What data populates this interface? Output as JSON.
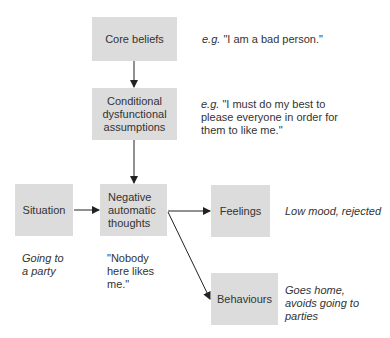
{
  "nodes": {
    "core": {
      "label": "Core beliefs",
      "note_prefix": "e.g.",
      "note": " \"I am a bad person.\""
    },
    "conditional": {
      "label_lines": [
        "Conditional",
        "dysfunctional",
        "assumptions"
      ],
      "note_prefix": "e.g.",
      "note_lines": [
        " \"I must do my best to",
        "please everyone in order for",
        "them to like me.\""
      ]
    },
    "situation": {
      "label": "Situation",
      "note_lines": [
        "Going to",
        "a party"
      ]
    },
    "negative": {
      "label_lines": [
        "Negative",
        "automatic",
        "thoughts"
      ],
      "note_lines": [
        "\"Nobody",
        "here likes",
        "me.\""
      ]
    },
    "feelings": {
      "label": "Feelings",
      "note": "Low mood, rejected"
    },
    "behaviours": {
      "label": "Behaviours",
      "note_lines": [
        "Goes home,",
        "avoids going to",
        "parties"
      ]
    }
  },
  "edges": [
    {
      "from": "core",
      "to": "conditional"
    },
    {
      "from": "conditional",
      "to": "negative"
    },
    {
      "from": "situation",
      "to": "negative"
    },
    {
      "from": "negative",
      "to": "feelings"
    },
    {
      "from": "negative",
      "to": "behaviours"
    }
  ],
  "colors": {
    "box_fill": "#dcdcdc",
    "text": "#333333",
    "arrow": "#222222"
  }
}
